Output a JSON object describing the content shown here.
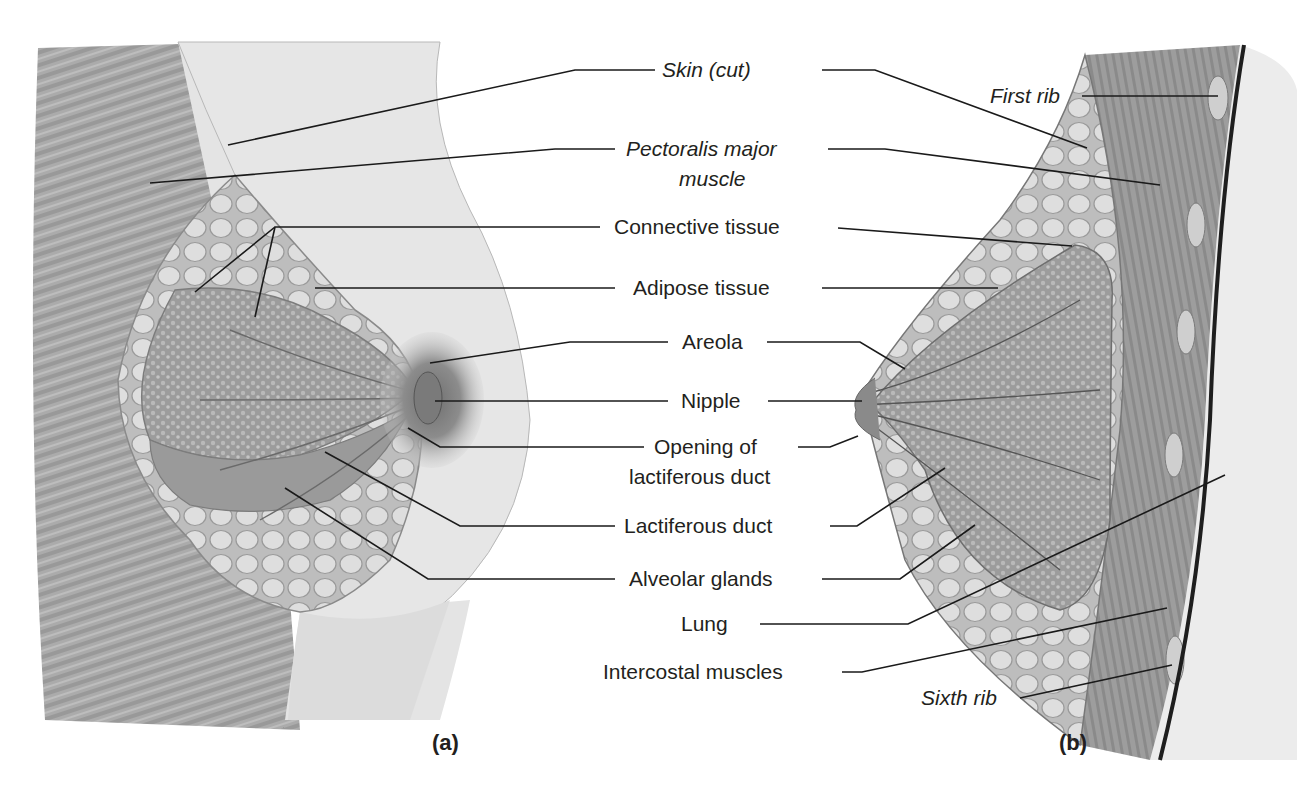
{
  "figure": {
    "panels": [
      {
        "id": "a",
        "label": "(a)",
        "view": "anterior view, partial dissection"
      },
      {
        "id": "b",
        "label": "(b)",
        "view": "sagittal section"
      }
    ],
    "labels": {
      "skin_cut": "Skin (cut)",
      "pectoralis_line1": "Pectoralis major",
      "pectoralis_line2": "muscle",
      "connective_tissue": "Connective tissue",
      "adipose_tissue": "Adipose tissue",
      "areola": "Areola",
      "nipple": "Nipple",
      "opening_line1": "Opening of",
      "opening_line2": "lactiferous duct",
      "lactiferous_duct": "Lactiferous duct",
      "alveolar_glands": "Alveolar glands",
      "lung": "Lung",
      "intercostal_muscles": "Intercostal muscles",
      "first_rib": "First rib",
      "sixth_rib": "Sixth rib"
    },
    "colors": {
      "text": "#231f20",
      "leader_line": "#1a1a1a",
      "muscle": "#9a9a9a",
      "skin": "#e6e6e6",
      "gland": "#a8a8a8",
      "fat": "#d2d2d2",
      "chest_wall": "#8c8c8c",
      "pleura": "#1e1e1e"
    }
  }
}
